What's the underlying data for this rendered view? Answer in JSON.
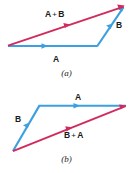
{
  "figure": {
    "type": "vector-addition-parallelogram-commutative",
    "background": "#ffffff",
    "width": 133,
    "height": 173,
    "colors": {
      "vector_a": "#3b9fe0",
      "vector_b": "#3b9fe0",
      "resultant": "#d32a5e",
      "text": "#1a1a1a"
    }
  },
  "panels": [
    {
      "id": "panel-a",
      "caption": "(a)",
      "labels": {
        "resultant": {
          "first": "A",
          "operator": "+",
          "second": "B"
        },
        "base": "A",
        "side": "B"
      },
      "vectors": [
        {
          "name": "A",
          "from": [
            8,
            46
          ],
          "to": [
            97,
            46
          ],
          "color": "#3b9fe0"
        },
        {
          "name": "B",
          "from": [
            97,
            46
          ],
          "to": [
            124,
            7
          ],
          "color": "#3b9fe0"
        },
        {
          "name": "A + B",
          "from": [
            8,
            46
          ],
          "to": [
            124,
            7
          ],
          "color": "#d32a5e"
        }
      ]
    },
    {
      "id": "panel-b",
      "caption": "(b)",
      "labels": {
        "resultant": {
          "first": "B",
          "operator": "+",
          "second": "A"
        },
        "base": "A",
        "side": "B"
      },
      "vectors": [
        {
          "name": "B",
          "from": [
            13,
            151
          ],
          "to": [
            39,
            106
          ],
          "color": "#3b9fe0"
        },
        {
          "name": "A",
          "from": [
            39,
            106
          ],
          "to": [
            126,
            106
          ],
          "color": "#3b9fe0"
        },
        {
          "name": "B + A",
          "from": [
            13,
            151
          ],
          "to": [
            126,
            106
          ],
          "color": "#d32a5e"
        }
      ]
    }
  ]
}
